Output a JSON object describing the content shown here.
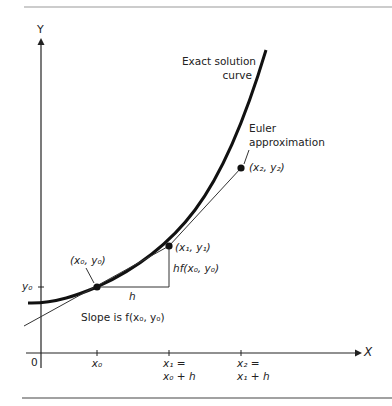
{
  "axes": {
    "y_label": "Y",
    "x_label": "X",
    "origin_label": "0",
    "y_tick_label": "y₀",
    "x_ticks": [
      {
        "line1": "x₀",
        "line2": ""
      },
      {
        "line1": "x₁ =",
        "line2": "x₀ + h"
      },
      {
        "line1": "x₂ =",
        "line2": "x₁ + h"
      }
    ]
  },
  "labels": {
    "exact_line1": "Exact solution",
    "exact_line2": "curve",
    "euler_line1": "Euler",
    "euler_line2": "approximation",
    "point0": "(x₀, y₀)",
    "point1": "(x₁, y₁)",
    "point2": "(x₂, y₂)",
    "step": "h",
    "rise": "hf(x₀, y₀)",
    "slope": "Slope is f(x₀, y₀)"
  },
  "colors": {
    "ink": "#1a1a1a",
    "rule": "#888888"
  }
}
